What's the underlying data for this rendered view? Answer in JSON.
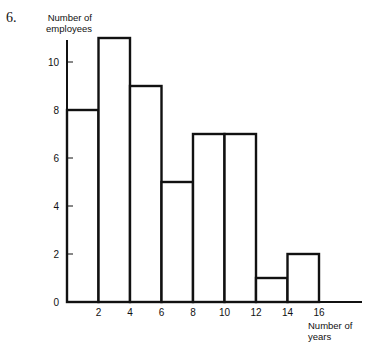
{
  "question_number": "6.",
  "chart_data": {
    "type": "bar",
    "subtype": "histogram",
    "title": "",
    "xlabel": "Number of years",
    "ylabel": "Number of employees",
    "bins": [
      [
        0,
        2
      ],
      [
        2,
        4
      ],
      [
        4,
        6
      ],
      [
        6,
        8
      ],
      [
        8,
        10
      ],
      [
        10,
        12
      ],
      [
        12,
        14
      ],
      [
        14,
        16
      ]
    ],
    "categories": [
      "0-2",
      "2-4",
      "4-6",
      "6-8",
      "8-10",
      "10-12",
      "12-14",
      "14-16"
    ],
    "values": [
      8,
      11,
      9,
      5,
      7,
      7,
      1,
      2
    ],
    "x_ticks": [
      "2",
      "4",
      "6",
      "8",
      "10",
      "12",
      "14",
      "16"
    ],
    "y_ticks": [
      "0",
      "2",
      "4",
      "6",
      "8",
      "10"
    ],
    "xlim": [
      0,
      18
    ],
    "ylim": [
      0,
      11
    ],
    "grid": false,
    "legend": null
  }
}
